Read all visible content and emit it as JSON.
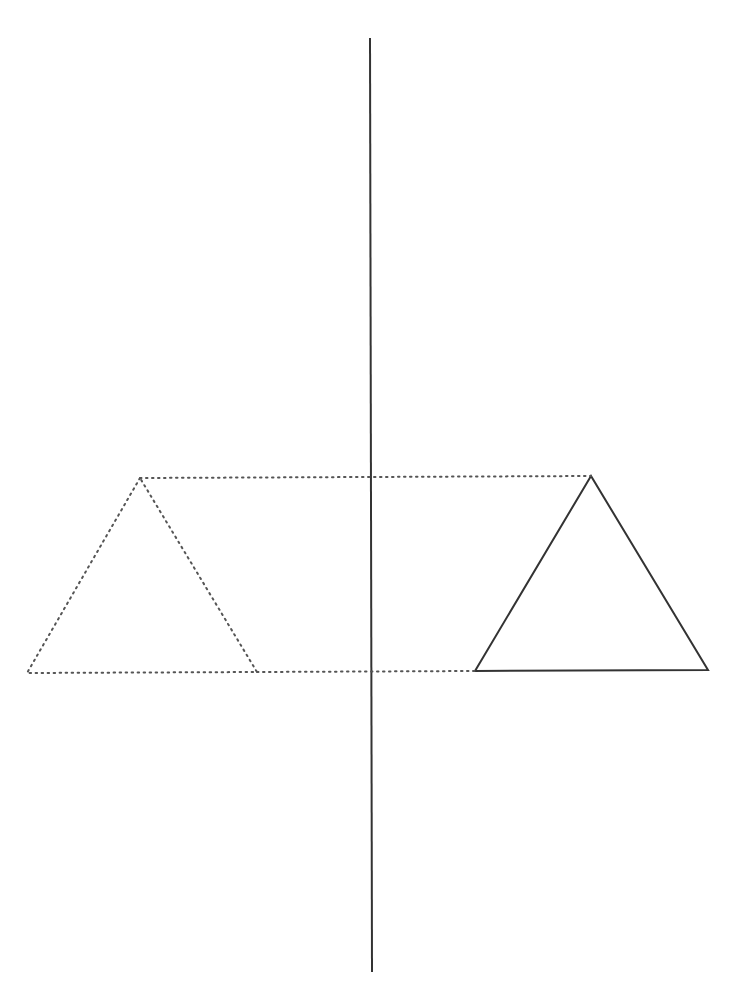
{
  "diagram": {
    "title": "",
    "type": "reflection",
    "colors": {
      "background": "#ffffff",
      "stroke": "#333333",
      "dotted": "#555555"
    },
    "mirror_line": {
      "x1": 370,
      "y1": 38,
      "x2": 372,
      "y2": 972
    },
    "original_triangle": {
      "style": "solid",
      "points": [
        [
          591,
          476
        ],
        [
          475,
          671
        ],
        [
          708,
          670
        ]
      ]
    },
    "reflected_triangle": {
      "style": "dotted",
      "points": [
        [
          140,
          478
        ],
        [
          27,
          673
        ],
        [
          257,
          672
        ]
      ]
    },
    "connectors": [
      {
        "from": [
          140,
          478
        ],
        "to": [
          591,
          476
        ],
        "style": "dotted"
      },
      {
        "from": [
          257,
          672
        ],
        "to": [
          475,
          671
        ],
        "style": "dotted"
      }
    ]
  }
}
